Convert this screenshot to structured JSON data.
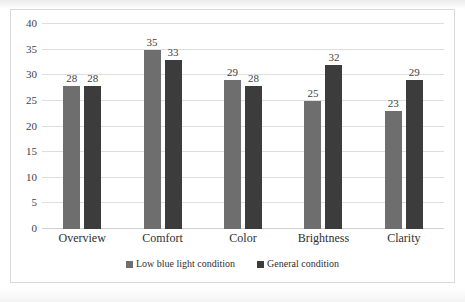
{
  "chart_data": {
    "type": "bar",
    "title": "",
    "subtitle": "",
    "xlabel": "",
    "ylabel": "",
    "categories": [
      "Overview",
      "Comfort",
      "Color",
      "Brightness",
      "Clarity"
    ],
    "series": [
      {
        "name": "Low blue light condition",
        "color": "#6e6e6e",
        "values": [
          28,
          35,
          29,
          25,
          23
        ]
      },
      {
        "name": "General condition",
        "color": "#3c3c3c",
        "values": [
          28,
          33,
          28,
          32,
          29
        ]
      }
    ],
    "ylim": [
      0,
      40
    ],
    "ytick_step": 5,
    "yticks": [
      40,
      35,
      30,
      25,
      20,
      15,
      10,
      5,
      0
    ],
    "ytick_labels": [
      "40",
      "35",
      "30",
      "25",
      "20",
      "15",
      "10",
      "5",
      "0"
    ],
    "grid": true,
    "grid_axis": "y",
    "legend_position": "bottom",
    "data_labels": true,
    "border_color": "#d9d9d9",
    "background": "#ffffff"
  }
}
